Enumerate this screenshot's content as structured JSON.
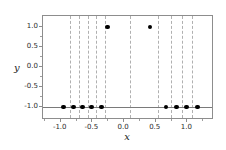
{
  "chart_data": {
    "type": "scatter",
    "title": "",
    "xlabel": "x",
    "ylabel": "y",
    "xlim": [
      -1.28,
      1.42
    ],
    "ylim": [
      -1.32,
      1.28
    ],
    "grid": false,
    "legend": null,
    "xticks": [
      -1.0,
      -0.5,
      0.0,
      0.5,
      1.0
    ],
    "xticklabels": [
      "-1.0",
      "-0.5",
      "0.0",
      "0.5",
      "1.0"
    ],
    "yticks": [
      -1.0,
      -0.5,
      0.0,
      0.5,
      1.0
    ],
    "yticklabels": [
      "-1.0",
      "-0.5",
      "0.0",
      "0.5",
      "1.0"
    ],
    "xminorticks": [
      -1.25,
      -0.75,
      -0.25,
      0.25,
      0.75,
      1.25
    ],
    "yminorticks": [
      -0.75,
      -0.25,
      0.25,
      0.75
    ],
    "marker": "circle",
    "marker_color": "#000000",
    "marker_size": 4.6,
    "x": [
      -0.96,
      -0.8,
      -0.66,
      -0.51,
      -0.36,
      -0.26,
      0.41,
      0.66,
      0.83,
      0.99,
      1.16
    ],
    "y": [
      -1.0,
      -1.0,
      -1.0,
      -1.0,
      -1.0,
      1.0,
      1.0,
      -1.0,
      -1.0,
      -1.0,
      -1.0
    ],
    "points": [
      {
        "x": -0.96,
        "y": -1.0
      },
      {
        "x": -0.8,
        "y": -1.0
      },
      {
        "x": -0.66,
        "y": -1.0
      },
      {
        "x": -0.51,
        "y": -1.0
      },
      {
        "x": -0.36,
        "y": -1.0
      },
      {
        "x": -0.26,
        "y": 1.0
      },
      {
        "x": 0.41,
        "y": 1.0
      },
      {
        "x": 0.66,
        "y": -1.0
      },
      {
        "x": 0.83,
        "y": -1.0
      },
      {
        "x": 0.99,
        "y": -1.0
      },
      {
        "x": 1.16,
        "y": -1.0
      }
    ],
    "hlines": [
      {
        "y": -1.0,
        "color": "#7a7a7a",
        "style": "solid"
      }
    ],
    "vlines": [
      {
        "x": -0.86,
        "color": "#b0b0b0",
        "style": "dashed"
      },
      {
        "x": -0.71,
        "color": "#b0b0b0",
        "style": "dashed"
      },
      {
        "x": -0.57,
        "color": "#b0b0b0",
        "style": "dashed"
      },
      {
        "x": -0.44,
        "color": "#b0b0b0",
        "style": "dashed"
      },
      {
        "x": -0.3,
        "color": "#b0b0b0",
        "style": "dashed"
      },
      {
        "x": 0.1,
        "color": "#b0b0b0",
        "style": "dashed"
      },
      {
        "x": 0.54,
        "color": "#b0b0b0",
        "style": "dashed"
      },
      {
        "x": 0.74,
        "color": "#b0b0b0",
        "style": "dashed"
      },
      {
        "x": 0.91,
        "color": "#b0b0b0",
        "style": "dashed"
      },
      {
        "x": 1.07,
        "color": "#b0b0b0",
        "style": "dashed"
      }
    ],
    "axes_color": "#8d8d8d",
    "background": "#ffffff"
  }
}
